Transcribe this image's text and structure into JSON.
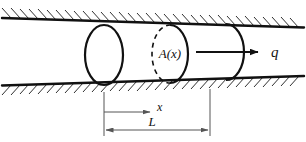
{
  "figure": {
    "type": "engineering-schematic",
    "width": 306,
    "height": 142,
    "background_color": "#ffffff",
    "line_color": "#111111",
    "labels": {
      "cross_section_area": "A(x)",
      "flow_rate": "q",
      "distance": "x",
      "length": "L"
    },
    "geometry": {
      "top_wall": {
        "x1": 2,
        "y1": 18,
        "x2": 304,
        "y2": 27
      },
      "bottom_wall": {
        "x1": 2,
        "y1": 85,
        "x2": 304,
        "y2": 76
      },
      "hatch_side_top": "above",
      "hatch_side_bottom": "below",
      "hatch_count_top": 34,
      "hatch_count_bottom": 34,
      "left_ellipse": {
        "cx": 104,
        "cy": 55,
        "rx": 19,
        "ry": 30
      },
      "mid_ellipse": {
        "cx": 170,
        "cy": 54,
        "rx": 18,
        "ry": 29,
        "left_half": "dashed",
        "right_half": "solid"
      },
      "right_cap": {
        "cx": 226,
        "cy": 52,
        "rx": 18,
        "ry": 28,
        "half": "right-solid"
      },
      "flow_arrow": {
        "x1": 196,
        "y1": 52,
        "x2": 258,
        "y2": 52
      },
      "x_dimension": {
        "x1": 104,
        "x2": 152,
        "y": 112
      },
      "l_dimension": {
        "x1": 104,
        "x2": 210,
        "y": 130
      },
      "extension_left_x": 104,
      "extension_right_x": 210
    },
    "label_positions": {
      "area": {
        "x": 170,
        "y": 57
      },
      "flow": {
        "x": 274,
        "y": 56
      },
      "distance": {
        "x": 158,
        "y": 110
      },
      "length": {
        "x": 152,
        "y": 126
      }
    }
  }
}
